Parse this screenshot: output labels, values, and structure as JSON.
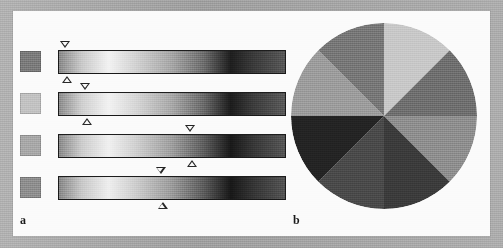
{
  "figure": {
    "width": 503,
    "height": 248,
    "page_background_color": "#a9a9a9",
    "panel_background_color": "#fbfbfb",
    "panel_label_a": "a",
    "panel_label_b": "b"
  },
  "chart_data": {
    "type": "table",
    "title": "",
    "subtitle": "",
    "xlabel": "",
    "ylabel": "",
    "legend_position": "none",
    "grid": false,
    "panels": [
      {
        "label": "a",
        "description": "Four grayscale gradient bars, each preceded by a solid gray reference swatch, with paired down/up triangular markers indicating a position along each bar.",
        "rows": [
          {
            "index": 1,
            "swatch_color": "#7b7b7b",
            "marker_position_pct": 3,
            "marker_down": "▽",
            "marker_up": "△",
            "gradient_stops": [
              {
                "pos_pct": 0,
                "color": "#8a8a8a"
              },
              {
                "pos_pct": 10,
                "color": "#c9c9c9"
              },
              {
                "pos_pct": 22,
                "color": "#f2f2f2"
              },
              {
                "pos_pct": 34,
                "color": "#d2d2d2"
              },
              {
                "pos_pct": 50,
                "color": "#a6a6a6"
              },
              {
                "pos_pct": 64,
                "color": "#6d6d6d"
              },
              {
                "pos_pct": 76,
                "color": "#1e1e1e"
              },
              {
                "pos_pct": 86,
                "color": "#3a3a3a"
              },
              {
                "pos_pct": 100,
                "color": "#585858"
              }
            ]
          },
          {
            "index": 2,
            "swatch_color": "#c2c2c2",
            "marker_position_pct": 12,
            "marker_down": "▽",
            "marker_up": "△",
            "gradient_stops": [
              {
                "pos_pct": 0,
                "color": "#8d8d8d"
              },
              {
                "pos_pct": 10,
                "color": "#cfcfcf"
              },
              {
                "pos_pct": 22,
                "color": "#f2f2f2"
              },
              {
                "pos_pct": 34,
                "color": "#d6d6d6"
              },
              {
                "pos_pct": 50,
                "color": "#a8a8a8"
              },
              {
                "pos_pct": 64,
                "color": "#6a6a6a"
              },
              {
                "pos_pct": 76,
                "color": "#1c1c1c"
              },
              {
                "pos_pct": 86,
                "color": "#3c3c3c"
              },
              {
                "pos_pct": 100,
                "color": "#5a5a5a"
              }
            ]
          },
          {
            "index": 3,
            "swatch_color": "#a8a8a8",
            "marker_position_pct": 58,
            "marker_down": "▽",
            "marker_up": "△",
            "gradient_stops": [
              {
                "pos_pct": 0,
                "color": "#8b8b8b"
              },
              {
                "pos_pct": 10,
                "color": "#cccccc"
              },
              {
                "pos_pct": 22,
                "color": "#f0f0f0"
              },
              {
                "pos_pct": 34,
                "color": "#d0d0d0"
              },
              {
                "pos_pct": 50,
                "color": "#9e9e9e"
              },
              {
                "pos_pct": 64,
                "color": "#5e5e5e"
              },
              {
                "pos_pct": 76,
                "color": "#191919"
              },
              {
                "pos_pct": 86,
                "color": "#373737"
              },
              {
                "pos_pct": 100,
                "color": "#565656"
              }
            ]
          },
          {
            "index": 4,
            "swatch_color": "#8e8e8e",
            "marker_position_pct": 45,
            "marker_down": "▽",
            "marker_up": "△",
            "gradient_stops": [
              {
                "pos_pct": 0,
                "color": "#888888"
              },
              {
                "pos_pct": 10,
                "color": "#c8c8c8"
              },
              {
                "pos_pct": 22,
                "color": "#eeeeee"
              },
              {
                "pos_pct": 34,
                "color": "#cdcdcd"
              },
              {
                "pos_pct": 50,
                "color": "#9b9b9b"
              },
              {
                "pos_pct": 64,
                "color": "#5c5c5c"
              },
              {
                "pos_pct": 76,
                "color": "#181818"
              },
              {
                "pos_pct": 86,
                "color": "#353535"
              },
              {
                "pos_pct": 100,
                "color": "#545454"
              }
            ]
          }
        ]
      },
      {
        "label": "b",
        "description": "Circular disc divided into eight equal 45-degree wedges of differing gray levels, boundaries at 0, 45, 90, 135, 180, 225, 270 and 315 degrees.",
        "disc": {
          "center_x": 384,
          "center_y": 116,
          "radius": 93,
          "wedge_count": 8,
          "wedges": [
            {
              "index": 1,
              "start_deg": 0,
              "end_deg": 45,
              "color": "#c8c8c8",
              "name": "wedge-12-to-1-30"
            },
            {
              "index": 2,
              "start_deg": 45,
              "end_deg": 90,
              "color": "#6f6f6f",
              "name": "wedge-1-30-to-3"
            },
            {
              "index": 3,
              "start_deg": 90,
              "end_deg": 135,
              "color": "#8e8e8e",
              "name": "wedge-3-to-4-30"
            },
            {
              "index": 4,
              "start_deg": 135,
              "end_deg": 180,
              "color": "#3b3b3b",
              "name": "wedge-4-30-to-6"
            },
            {
              "index": 5,
              "start_deg": 180,
              "end_deg": 225,
              "color": "#4a4a4a",
              "name": "wedge-6-to-7-30"
            },
            {
              "index": 6,
              "start_deg": 225,
              "end_deg": 270,
              "color": "#242424",
              "name": "wedge-7-30-to-9"
            },
            {
              "index": 7,
              "start_deg": 270,
              "end_deg": 315,
              "color": "#9c9c9c",
              "name": "wedge-9-to-10-30"
            },
            {
              "index": 8,
              "start_deg": 315,
              "end_deg": 360,
              "color": "#777777",
              "name": "wedge-10-30-to-12"
            }
          ]
        }
      }
    ]
  }
}
